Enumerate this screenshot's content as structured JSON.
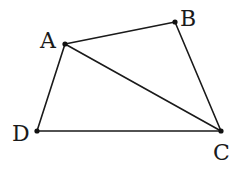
{
  "figure": {
    "type": "quadrilateral-with-diagonal",
    "stroke_color": "#1a1a1a",
    "background": "#ffffff",
    "points": {
      "A": {
        "label": "A",
        "x": 65,
        "y": 44,
        "label_x": 40,
        "label_y": 48
      },
      "B": {
        "label": "B",
        "x": 175,
        "y": 22,
        "label_x": 180,
        "label_y": 26
      },
      "C": {
        "label": "C",
        "x": 221,
        "y": 131,
        "label_x": 213,
        "label_y": 160
      },
      "D": {
        "label": "D",
        "x": 37,
        "y": 131,
        "label_x": 12,
        "label_y": 141
      }
    },
    "segments": [
      {
        "name": "AB",
        "from": "A",
        "to": "B"
      },
      {
        "name": "BC",
        "from": "B",
        "to": "C"
      },
      {
        "name": "CD",
        "from": "C",
        "to": "D"
      },
      {
        "name": "DA",
        "from": "D",
        "to": "A"
      },
      {
        "name": "AC",
        "from": "A",
        "to": "C"
      }
    ]
  }
}
